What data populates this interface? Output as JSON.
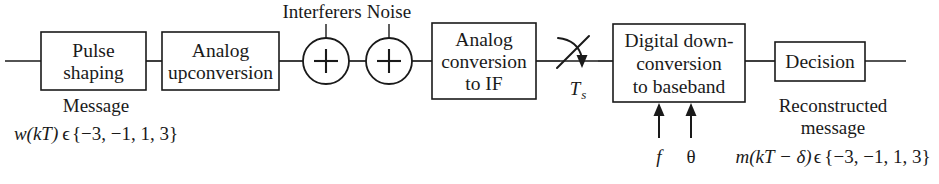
{
  "diagram": {
    "stroke_color": "#1a1a1a",
    "background_color": "#ffffff",
    "blocks": [
      {
        "id": "pulse_shaping",
        "line1": "Pulse",
        "line2": "shaping"
      },
      {
        "id": "analog_upconversion",
        "line1": "Analog",
        "line2": "upconversion"
      },
      {
        "id": "analog_conversion_if",
        "line1": "Analog",
        "line2": "conversion",
        "line3": "to IF"
      },
      {
        "id": "digital_downconversion",
        "line1": "Digital down-",
        "line2": "conversion",
        "line3": "to baseband"
      },
      {
        "id": "decision",
        "line1": "Decision"
      }
    ],
    "summing_junctions": [
      {
        "id": "interferers_sum",
        "symbol": "+",
        "input_label": "Interferers"
      },
      {
        "id": "noise_sum",
        "symbol": "+",
        "input_label": "Noise"
      }
    ],
    "sampler": {
      "id": "sampling_switch",
      "label_base": "T",
      "label_sub": "s"
    },
    "input_annotations": {
      "message_label": "Message",
      "message_symbol": "w(kT)",
      "message_membership": "ϵ",
      "message_alphabet": "{−3, −1, 1, 3}"
    },
    "downconversion_inputs": [
      {
        "id": "frequency_input",
        "label": "f",
        "italic": true
      },
      {
        "id": "phase_input",
        "label": "θ",
        "italic": false
      }
    ],
    "output_annotations": {
      "reconstructed_line1": "Reconstructed",
      "reconstructed_line2": "message",
      "output_symbol_m": "m",
      "output_symbol_arg": "(kT − δ)",
      "output_membership": "ϵ",
      "output_alphabet": "{−3, −1, 1, 3}"
    }
  }
}
